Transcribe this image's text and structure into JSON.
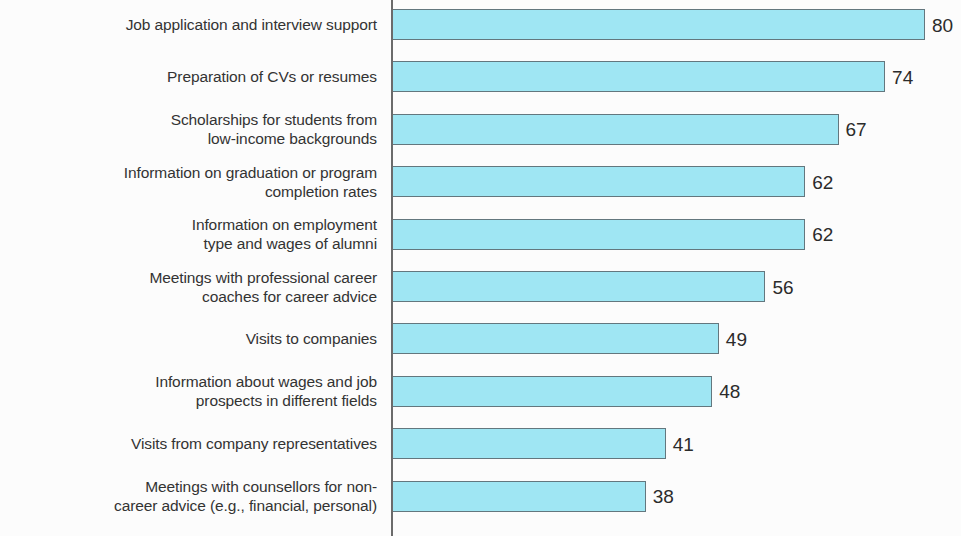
{
  "chart_data": {
    "type": "bar",
    "orientation": "horizontal",
    "title": "",
    "subtitle": "",
    "xlabel": "",
    "ylabel": "",
    "xlim": [
      0,
      80
    ],
    "grid": false,
    "legend": null,
    "bar_color": "#9fe6f3",
    "bar_border_color": "#63777e",
    "axis_color": "#6b6b6b",
    "label_color": "#333333",
    "value_color": "#2b2b2b",
    "background_color": "#fcfcfc",
    "categories": [
      "Job application and interview support",
      "Preparation of CVs or resumes",
      "Scholarships for students from\nlow-income backgrounds",
      "Information on graduation or program\ncompletion rates",
      "Information on employment\ntype and wages of alumni",
      "Meetings with professional career\ncoaches for career advice",
      "Visits to companies",
      "Information about wages and job\nprospects in different fields",
      "Visits from company representatives",
      "Meetings with counsellors for non-\ncareer advice (e.g., financial, personal)"
    ],
    "values": [
      80,
      74,
      67,
      62,
      62,
      56,
      49,
      48,
      41,
      38
    ],
    "value_labels": [
      "80",
      "74",
      "67",
      "62",
      "62",
      "56",
      "49",
      "48",
      "41",
      "38"
    ]
  }
}
